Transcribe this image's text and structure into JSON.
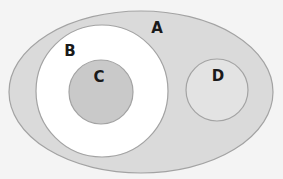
{
  "diagram": {
    "type": "venn-euler",
    "background": "#f4f4f4",
    "stroke_color": "#a3a3a3",
    "sets": [
      {
        "id": "A",
        "label": "A",
        "shape": "ellipse",
        "cx": 141,
        "cy": 92,
        "rx": 132,
        "ry": 81,
        "fill": "#dadada",
        "label_x": 157,
        "label_y": 33,
        "contains": [
          "B",
          "D"
        ]
      },
      {
        "id": "B",
        "label": "B",
        "shape": "circle",
        "cx": 102,
        "cy": 91,
        "r": 66,
        "fill": "#ffffff",
        "label_x": 70,
        "label_y": 56,
        "contains": [
          "C"
        ]
      },
      {
        "id": "C",
        "label": "C",
        "shape": "circle",
        "cx": 101,
        "cy": 92,
        "r": 32,
        "fill": "#c9c9c9",
        "label_x": 99,
        "label_y": 82,
        "contains": []
      },
      {
        "id": "D",
        "label": "D",
        "shape": "circle",
        "cx": 217,
        "cy": 90,
        "r": 31,
        "fill": "#e3e3e3",
        "label_x": 218,
        "label_y": 81,
        "contains": []
      }
    ]
  }
}
